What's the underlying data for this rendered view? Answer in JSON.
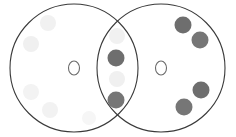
{
  "figure": {
    "type": "venn-diagram",
    "title": "",
    "background_color": "#ffffff",
    "width": 236,
    "height": 137
  },
  "style": {
    "outline_color": "#3a3a3a",
    "outline_width": 1.1,
    "center_marker_color": "#6a6a6a",
    "dot_dark_color": "#6e6e6e",
    "dot_dark_color_alt": "#767676",
    "dot_faint_color": "#f2f2f2",
    "dot_faint_color_alt": "#f6f6f6"
  },
  "sets": [
    {
      "id": "left-set",
      "name": "left-circle",
      "cx": 74,
      "cy": 68,
      "r": 64,
      "center_marker": {
        "label": "O",
        "cx": 74,
        "cy": 68,
        "rx": 5.5,
        "ry": 7
      }
    },
    {
      "id": "right-set",
      "name": "right-circle",
      "cx": 161,
      "cy": 68,
      "r": 64,
      "center_marker": {
        "label": "O",
        "cx": 161,
        "cy": 68,
        "rx": 5.5,
        "ry": 7
      }
    }
  ],
  "regions": {
    "left_only": "left-exclusive-region",
    "overlap": "intersection-region",
    "right_only": "right-exclusive-region"
  },
  "chart_data": {
    "type": "scatter",
    "title": "",
    "xlabel": "",
    "ylabel": "",
    "xlim": [
      0,
      236
    ],
    "ylim": [
      0,
      137
    ],
    "grid": false,
    "legend": null,
    "series": [
      {
        "name": "dark-points-overlap",
        "region": "overlap",
        "color": "#6e6e6e",
        "count": 2,
        "points": [
          {
            "x": 116,
            "y": 58,
            "r": 8.5,
            "color": "#6e6e6e"
          },
          {
            "x": 116,
            "y": 100,
            "r": 8.5,
            "color": "#767676"
          }
        ]
      },
      {
        "name": "dark-points-right-only",
        "region": "right_only",
        "color": "#6e6e6e",
        "count": 4,
        "points": [
          {
            "x": 183,
            "y": 25,
            "r": 8.5,
            "color": "#6e6e6e"
          },
          {
            "x": 200,
            "y": 40,
            "r": 8.5,
            "color": "#767676"
          },
          {
            "x": 201,
            "y": 90,
            "r": 8.5,
            "color": "#6e6e6e"
          },
          {
            "x": 184,
            "y": 107,
            "r": 8.5,
            "color": "#767676"
          }
        ]
      },
      {
        "name": "faint-points-left-only",
        "region": "left_only",
        "color": "#f2f2f2",
        "count": 5,
        "points": [
          {
            "x": 48,
            "y": 23,
            "r": 8.0,
            "color": "#f1f1f1"
          },
          {
            "x": 31,
            "y": 44,
            "r": 8.0,
            "color": "#f0f0f0"
          },
          {
            "x": 31,
            "y": 92,
            "r": 8.0,
            "color": "#f3f3f3"
          },
          {
            "x": 50,
            "y": 110,
            "r": 8.0,
            "color": "#f2f2f2"
          },
          {
            "x": 89,
            "y": 118,
            "r": 7.0,
            "color": "#f6f6f6"
          }
        ]
      },
      {
        "name": "faint-points-overlap",
        "region": "overlap",
        "color": "#f2f2f2",
        "count": 2,
        "points": [
          {
            "x": 117,
            "y": 36,
            "r": 8.0,
            "color": "#f1f1f1"
          },
          {
            "x": 117,
            "y": 79,
            "r": 8.0,
            "color": "#f0f0f0"
          }
        ]
      }
    ],
    "totals": {
      "dark_total": 6,
      "faint_total": 7,
      "dark_in_overlap": 2,
      "dark_in_right_only": 4,
      "dark_in_left_only": 0
    }
  }
}
